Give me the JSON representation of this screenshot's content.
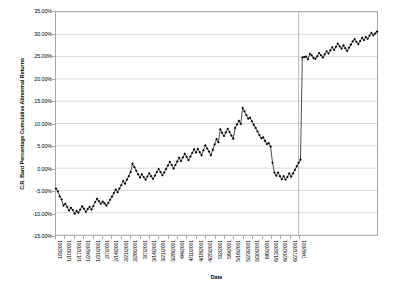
{
  "chart_data": {
    "type": "line",
    "title": "",
    "xlabel": "Date",
    "ylabel": "C.R. Bard Percentage Cumulative Abnormal Returns",
    "ylim": [
      -15,
      35
    ],
    "ytick_values": [
      35,
      30,
      25,
      20,
      15,
      10,
      5,
      0,
      -5,
      -10,
      -15
    ],
    "ytick_labels": [
      "35.00%",
      "30.00%",
      "25.00%",
      "20.00%",
      "15.00%",
      "10.00%",
      "5.00%",
      "0.00%",
      "-5.00%",
      "-10.00%",
      "-15.00%"
    ],
    "grid": true,
    "legend": false,
    "marker": "diamond",
    "series_color": "#000000",
    "grid_color": "#c8c8c8",
    "axis_color": "#a6a6a6",
    "xtick_labels": [
      "1/3/2001",
      "1/10/2001",
      "1/17/2001",
      "1/24/2001",
      "1/31/2001",
      "2/7/2001",
      "2/14/2001",
      "2/21/2001",
      "2/28/2001",
      "3/7/2001",
      "3/14/2001",
      "3/21/2001",
      "3/28/2001",
      "4/4/2001",
      "4/11/2001",
      "4/18/2001",
      "4/25/2001",
      "5/2/2001",
      "5/9/2001",
      "5/16/2001",
      "5/23/2001",
      "5/30/2001",
      "6/6/2001",
      "6/13/2001",
      "6/20/2001",
      "6/27/2001",
      "7/4/2001"
    ],
    "xtick_interval_points": 5,
    "x_index_range": [
      0,
      130
    ],
    "values": [
      -4.6,
      -5.2,
      -6.3,
      -7.0,
      -8.4,
      -8.0,
      -8.7,
      -9.5,
      -8.9,
      -9.4,
      -10.2,
      -9.6,
      -10.0,
      -9.3,
      -8.6,
      -9.1,
      -9.8,
      -9.2,
      -8.7,
      -9.3,
      -8.5,
      -7.6,
      -6.9,
      -7.4,
      -8.0,
      -7.5,
      -7.9,
      -8.4,
      -7.8,
      -7.1,
      -6.4,
      -5.6,
      -4.8,
      -5.4,
      -4.6,
      -3.8,
      -2.9,
      -3.5,
      -2.6,
      -1.8,
      -0.9,
      1.0,
      0.2,
      -0.6,
      -1.4,
      -2.1,
      -1.4,
      -2.0,
      -2.6,
      -1.9,
      -1.2,
      -1.8,
      -2.4,
      -1.7,
      -0.9,
      -0.2,
      -0.9,
      -1.6,
      -1.0,
      -0.2,
      0.6,
      1.4,
      0.7,
      -0.1,
      0.7,
      1.5,
      2.3,
      1.6,
      2.4,
      3.2,
      2.5,
      1.8,
      2.6,
      3.4,
      4.2,
      3.5,
      4.3,
      3.6,
      2.9,
      4.0,
      5.1,
      4.4,
      3.7,
      2.9,
      4.1,
      5.3,
      6.5,
      5.8,
      8.7,
      7.9,
      7.2,
      8.0,
      8.8,
      8.1,
      7.3,
      6.6,
      9.0,
      9.8,
      10.6,
      9.9,
      13.5,
      12.7,
      11.9,
      11.1,
      11.3,
      10.5,
      9.7,
      9.0,
      8.2,
      7.4,
      6.7,
      6.9,
      6.1,
      5.4,
      5.6,
      4.8,
      1.2,
      -1.0,
      -1.7,
      -1.0,
      -1.8,
      -2.5,
      -1.8,
      -2.6,
      -2.0,
      -1.2,
      -1.9,
      -1.2,
      -0.4,
      0.4,
      1.2,
      1.9,
      24.8,
      24.9,
      25.0,
      24.4,
      25.6,
      25.3,
      24.7,
      24.5,
      25.1,
      25.8,
      25.3,
      24.8,
      25.5,
      26.2,
      25.7,
      26.4,
      27.1,
      26.5,
      27.2,
      27.9,
      27.3,
      26.8,
      27.5,
      26.9,
      26.3,
      27.0,
      27.7,
      28.4,
      28.9,
      28.3,
      27.8,
      28.5,
      29.2,
      28.7,
      29.4,
      29.0,
      29.7,
      30.3,
      29.8,
      30.2,
      30.6
    ],
    "event_line": {
      "present": true,
      "label": "",
      "x_index": 130,
      "color": "#a6a6a6"
    },
    "annotations": []
  }
}
